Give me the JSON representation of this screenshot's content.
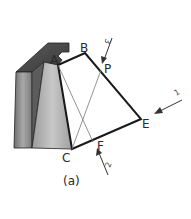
{
  "figure": {
    "caption": "(a)",
    "points": {
      "A": "A",
      "B": "B",
      "C": "C",
      "E": "E",
      "F": "F",
      "P": "P"
    },
    "arrows": [
      {
        "label": "3",
        "target": "P"
      },
      {
        "label": "1",
        "target": "E"
      },
      {
        "label": "2",
        "target": "F"
      }
    ],
    "colors": {
      "outline": "#1a1a1a",
      "thin_line": "#777777",
      "block_top": "#4a4a4a",
      "block_left": "#8a8a8a",
      "block_front": "#b8b8b8"
    }
  }
}
